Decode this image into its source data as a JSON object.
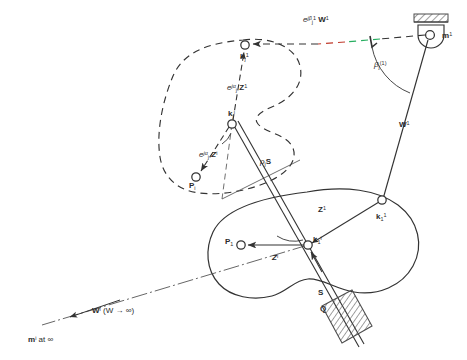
{
  "figure": {
    "type": "kinematic-synthesis-diagram",
    "colors": {
      "line": "#333333",
      "label": "#2b2b2b",
      "accent_red": "#c0392b",
      "accent_green": "#27ae60",
      "ground_hatch": "#4d4d4d"
    }
  },
  "labels": {
    "e_jbeta_w1": {
      "e": "e",
      "j": "j",
      "beta": "β",
      "beta_sub": "j",
      "beta_sup": "1",
      "w": "W",
      "w_sup": "1"
    },
    "m1": {
      "text": "m",
      "sup": "1"
    },
    "beta_angle": {
      "sym": "β",
      "sub": "j",
      "sup": "(1)"
    },
    "w1_link": {
      "text": "W",
      "sup": "1"
    },
    "kj1_upper": {
      "text": "k",
      "sub": "j",
      "sup": "1"
    },
    "e_jalpha_z1": {
      "e": "e",
      "j": "j",
      "alpha": "α",
      "alpha_sub": "j",
      "z": "Z",
      "z_sup": "1"
    },
    "kji": {
      "text": "k",
      "sub": "j",
      "sup": "i"
    },
    "e_jalpha_zi": {
      "e": "e",
      "j": "j",
      "alpha": "α",
      "alpha_sub": "j",
      "z": "Z",
      "z_sup": "i"
    },
    "pi": {
      "text": "P",
      "sub": "i"
    },
    "rho_j_s": {
      "rho": "ρ",
      "sub": "j",
      "s": "S"
    },
    "z1": {
      "text": "Z",
      "sup": "1"
    },
    "k11": {
      "text": "k",
      "sub": "1",
      "sup": "1"
    },
    "p1": {
      "text": "P",
      "sub": "1"
    },
    "zi": {
      "text": "Z",
      "sup": "i"
    },
    "k1i": {
      "text": "k",
      "sub": "1",
      "sup": "i"
    },
    "s_axis": {
      "text": "S"
    },
    "q_point": {
      "text": "Q"
    },
    "wi_infinite": {
      "w": "W",
      "sup": "i",
      "paren": "(W → ∞)"
    },
    "mi_at_infinity": {
      "m": "m",
      "sup": "i",
      "tail": "at ∞"
    }
  },
  "geometry": {
    "fixed_pivot_m1": {
      "x": 430,
      "y": 35
    },
    "k11_joint": {
      "x": 382,
      "y": 200
    },
    "k1i_joint": {
      "x": 308,
      "y": 245
    },
    "p1_point": {
      "x": 240,
      "y": 244
    },
    "kj1_joint": {
      "x": 245,
      "y": 44
    },
    "kji_joint": {
      "x": 232,
      "y": 124
    },
    "pi_point": {
      "x": 196,
      "y": 176
    },
    "q_slider_point": {
      "x": 345,
      "y": 325
    },
    "wi_arrow_tip": {
      "x": 45,
      "y": 323
    }
  }
}
